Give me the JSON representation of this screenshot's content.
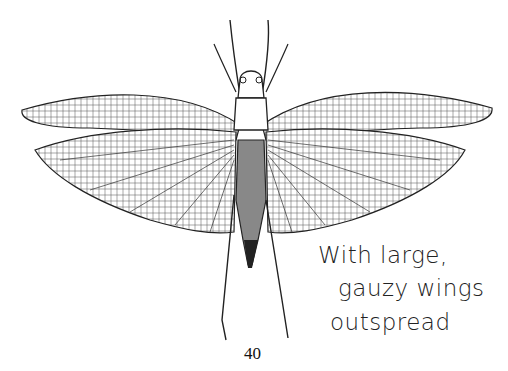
{
  "page": {
    "illustration": {
      "subject": "winged insect with outspread wings",
      "icon": "insect-illustration"
    },
    "caption": {
      "lines": [
        "With large,",
        "gauzy wings",
        "outspread"
      ]
    },
    "page_number": "40"
  }
}
